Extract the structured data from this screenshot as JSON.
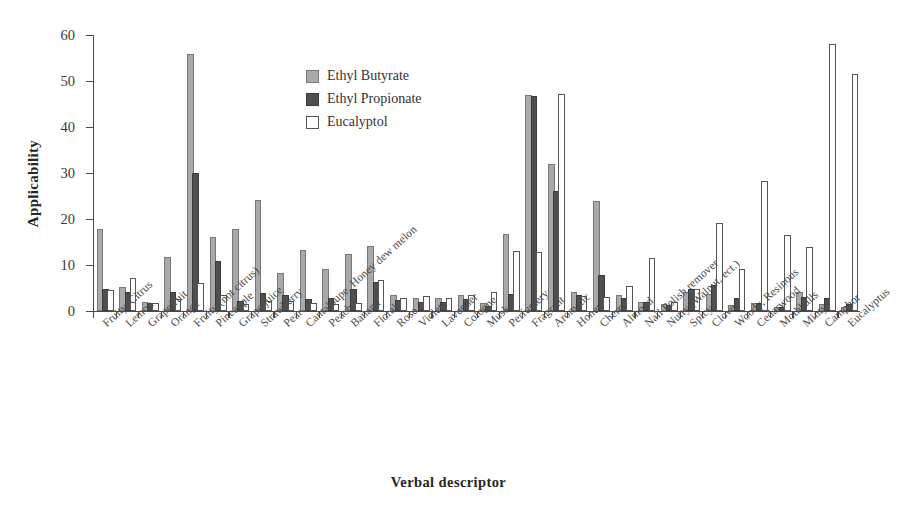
{
  "chart_data": {
    "type": "bar",
    "title": "",
    "xlabel": "Verbal descriptor",
    "ylabel": "Applicability",
    "ylim": [
      0,
      60
    ],
    "yticks": [
      0,
      10,
      20,
      30,
      40,
      50,
      60
    ],
    "grid": false,
    "legend_position": "upper-center-left",
    "categories": [
      "Fruity, Citrus",
      "Lemon",
      "Grapefruit",
      "Orange",
      "Fruity (not citrus)",
      "Pineapple",
      "Grape juice",
      "Strawberry",
      "Pear",
      "Cantaloupe, Honey dew melon",
      "Peach",
      "Banana",
      "Floral",
      "Rose",
      "Violets",
      "Lavender",
      "Cologne",
      "Musk",
      "Perfumery",
      "Fragrant",
      "Aromatic",
      "Honey",
      "Cherry",
      "Almond",
      "Nail Polish remover",
      "Nutty (Walnut, ect.)",
      "Spicy",
      "Clove",
      "Woody, Resinous",
      "Cedarwood",
      "Mothballs",
      "Minty",
      "Camphor",
      "Eucalyptus"
    ],
    "series": [
      {
        "name": "Ethyl Butyrate",
        "color": "#a9a9a9",
        "values": [
          17.4,
          4.8,
          1.6,
          11.3,
          55.5,
          15.6,
          17.3,
          23.7,
          7.9,
          12.9,
          8.7,
          12.0,
          13.6,
          3.1,
          2.4,
          2.3,
          3.0,
          1.3,
          16.2,
          46.5,
          31.6,
          3.7,
          23.5,
          3.0,
          1.5,
          1.0,
          3.7,
          3.2,
          0.9,
          1.4,
          0.4,
          3.6,
          1.1,
          0.5
        ]
      },
      {
        "name": "Ethyl Propionate",
        "color": "#4f4f4f",
        "values": [
          4.4,
          3.7,
          1.3,
          3.6,
          29.5,
          10.5,
          1.8,
          3.5,
          3.0,
          2.1,
          2.5,
          4.4,
          5.9,
          2.0,
          1.6,
          1.6,
          2.1,
          0.7,
          3.2,
          46.3,
          25.7,
          3.1,
          7.3,
          2.4,
          1.5,
          0.9,
          4.4,
          5.3,
          2.3,
          1.3,
          0.4,
          2.6,
          2.3,
          1.0
        ]
      },
      {
        "name": "Eucalyptol",
        "color": "#ffffff",
        "values": [
          4.1,
          6.8,
          1.2,
          2.1,
          5.7,
          3.0,
          1.0,
          1.7,
          1.7,
          1.3,
          1.1,
          1.2,
          6.3,
          2.4,
          2.8,
          2.5,
          3.0,
          3.8,
          12.7,
          12.3,
          46.8,
          2.8,
          2.7,
          5.0,
          11.0,
          1.5,
          4.4,
          18.8,
          8.6,
          27.9,
          16.1,
          13.5,
          57.7,
          51.0
        ]
      }
    ]
  },
  "legend": {
    "entries": [
      {
        "label": "Ethyl Butyrate"
      },
      {
        "label": "Ethyl Propionate"
      },
      {
        "label": "Eucalyptol"
      }
    ]
  }
}
